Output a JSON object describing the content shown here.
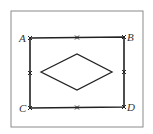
{
  "diagram": {
    "points": {
      "A": {
        "label": "A",
        "x": 30,
        "y": 38
      },
      "B": {
        "label": "B",
        "x": 124,
        "y": 37
      },
      "C": {
        "label": "C",
        "x": 30,
        "y": 108
      },
      "D": {
        "label": "D",
        "x": 124,
        "y": 107
      }
    },
    "midpoint_marks": 4,
    "inner_shape": "rhombus",
    "colors": {
      "stroke": "#222222",
      "frame": "#777777",
      "background": "#ffffff"
    }
  }
}
